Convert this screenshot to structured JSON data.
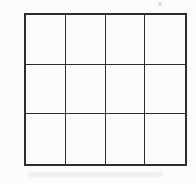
{
  "figure": {
    "description": "Scanned black line drawing of a square outline subdivided into a grid of 12 empty cells (4 columns by 3 rows)",
    "grid": {
      "rows": 3,
      "cols": 4,
      "cell_count": 12
    },
    "colors": {
      "line": "#2d2d2d",
      "background": "#fcfcfb"
    }
  }
}
